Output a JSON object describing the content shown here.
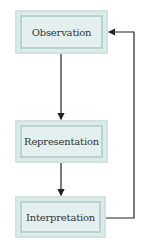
{
  "diagram": {
    "type": "flowchart-cycle",
    "nodes": [
      {
        "id": "observation",
        "label": "Observation"
      },
      {
        "id": "representation",
        "label": "Representation"
      },
      {
        "id": "interpretation",
        "label": "Interpretation"
      }
    ],
    "edges": [
      {
        "from": "observation",
        "to": "representation"
      },
      {
        "from": "representation",
        "to": "interpretation"
      },
      {
        "from": "interpretation",
        "to": "observation"
      }
    ],
    "colors": {
      "box_fill": "#e4f0ef",
      "box_border_outer": "#cfe3e1",
      "box_border_inner": "#b9d3d0",
      "line": "#222222",
      "text": "#333333"
    }
  }
}
